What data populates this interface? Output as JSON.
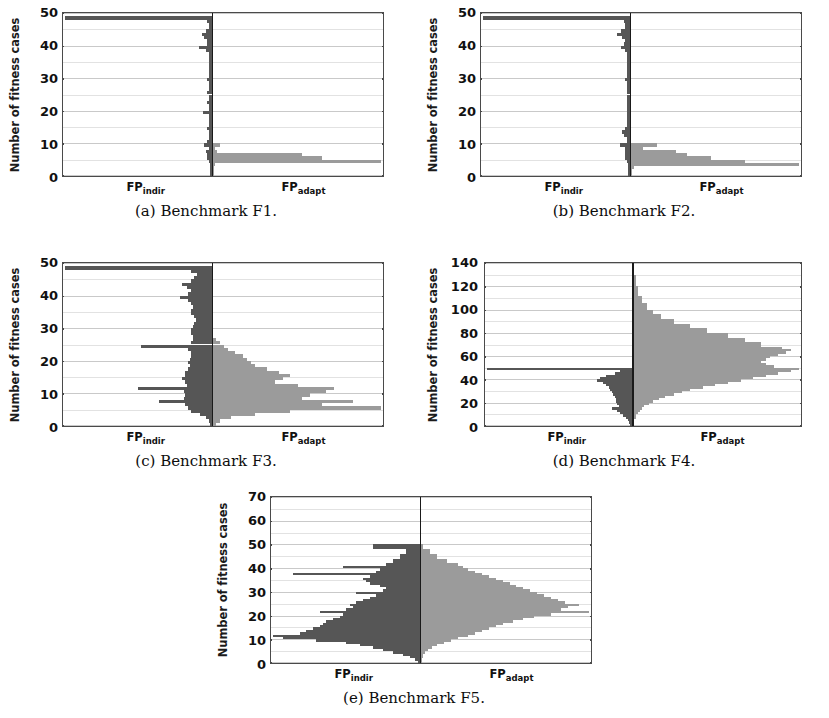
{
  "figure": {
    "ylabel": "Number of fitness cases",
    "left_series_label_main": "FP",
    "left_series_label_sub": "indir",
    "right_series_label_main": "FP",
    "right_series_label_sub": "adapt",
    "colors": {
      "left_bar": "#565656",
      "right_bar": "#9b9b9b",
      "axis": "#4a4a4a",
      "grid": "#c9c9c9",
      "center_line": "#1a1a1a",
      "background": "#ffffff"
    }
  },
  "panels": [
    {
      "key": "a",
      "caption": "(a) Benchmark F1.",
      "yticks": [
        "0",
        "10",
        "20",
        "30",
        "40",
        "50"
      ]
    },
    {
      "key": "b",
      "caption": "(b) Benchmark F2.",
      "yticks": [
        "0",
        "10",
        "20",
        "30",
        "40",
        "50"
      ]
    },
    {
      "key": "c",
      "caption": "(c) Benchmark F3.",
      "yticks": [
        "0",
        "10",
        "20",
        "30",
        "40",
        "50"
      ]
    },
    {
      "key": "d",
      "caption": "(d) Benchmark F4.",
      "yticks": [
        "0",
        "20",
        "40",
        "60",
        "80",
        "100",
        "120",
        "140"
      ]
    },
    {
      "key": "e",
      "caption": "(e) Benchmark F5.",
      "yticks": [
        "0",
        "10",
        "20",
        "30",
        "40",
        "50",
        "60",
        "70"
      ]
    }
  ],
  "chart_data": [
    {
      "id": "a",
      "type": "bar",
      "orientation": "horizontal-butterfly",
      "title": "(a) Benchmark F1.",
      "xlabel": "",
      "ylabel": "Number of fitness cases",
      "ylim": [
        0,
        50
      ],
      "yticks": [
        0,
        10,
        20,
        30,
        40,
        50
      ],
      "grid": true,
      "legend": "none",
      "series": [
        {
          "name": "FP_indir",
          "side": "left",
          "color": "#565656",
          "y": [
            49,
            48,
            47,
            46,
            45,
            44,
            43,
            42,
            41,
            40,
            39,
            38,
            37,
            36,
            35,
            34,
            33,
            32,
            31,
            30,
            29,
            28,
            27,
            26,
            25,
            24,
            23,
            22,
            21,
            20,
            19,
            18,
            17,
            16,
            15,
            14,
            13,
            12,
            11,
            10,
            9,
            8,
            7,
            6,
            5,
            4,
            3,
            2,
            1
          ],
          "values": [
            100,
            3,
            2,
            2,
            4,
            7,
            5,
            3,
            3,
            9,
            4,
            2,
            2,
            2,
            2,
            2,
            2,
            2,
            2,
            3,
            2,
            2,
            2,
            3,
            2,
            2,
            3,
            2,
            2,
            6,
            2,
            2,
            2,
            2,
            3,
            2,
            2,
            2,
            3,
            5,
            2,
            4,
            3,
            3,
            2,
            1,
            1,
            1,
            1
          ]
        },
        {
          "name": "FP_adapt",
          "side": "right",
          "color": "#9b9b9b",
          "y": [
            49,
            48,
            47,
            46,
            45,
            44,
            43,
            42,
            41,
            40,
            39,
            38,
            37,
            36,
            35,
            34,
            33,
            32,
            31,
            30,
            29,
            28,
            27,
            26,
            25,
            24,
            23,
            22,
            21,
            20,
            19,
            18,
            17,
            16,
            15,
            14,
            13,
            12,
            11,
            10,
            9,
            8,
            7,
            6,
            5,
            4,
            3,
            2,
            1
          ],
          "values": [
            0,
            0,
            0,
            0,
            0,
            0,
            0,
            0,
            0,
            0,
            0,
            0,
            0,
            0,
            0,
            0,
            0,
            0,
            0,
            0,
            0,
            0,
            0,
            0,
            0,
            0,
            0,
            0,
            0,
            0,
            0,
            0,
            0,
            0,
            0,
            0,
            0,
            0,
            0,
            5,
            2,
            3,
            52,
            64,
            98,
            2,
            1,
            1,
            1
          ]
        }
      ]
    },
    {
      "id": "b",
      "type": "bar",
      "orientation": "horizontal-butterfly",
      "title": "(b) Benchmark F2.",
      "xlabel": "",
      "ylabel": "Number of fitness cases",
      "ylim": [
        0,
        50
      ],
      "yticks": [
        0,
        10,
        20,
        30,
        40,
        50
      ],
      "grid": true,
      "legend": "none",
      "series": [
        {
          "name": "FP_indir",
          "side": "left",
          "color": "#565656",
          "y": [
            49,
            48,
            47,
            46,
            45,
            44,
            43,
            42,
            41,
            40,
            39,
            38,
            37,
            36,
            35,
            34,
            33,
            32,
            31,
            30,
            29,
            28,
            27,
            26,
            25,
            24,
            23,
            22,
            21,
            20,
            19,
            18,
            17,
            16,
            15,
            14,
            13,
            12,
            11,
            10,
            9,
            8,
            7,
            6,
            5,
            4,
            3,
            2,
            1
          ],
          "values": [
            100,
            4,
            3,
            3,
            6,
            9,
            5,
            3,
            4,
            6,
            3,
            2,
            2,
            2,
            2,
            2,
            2,
            2,
            2,
            3,
            2,
            2,
            2,
            2,
            2,
            2,
            2,
            2,
            2,
            2,
            2,
            2,
            2,
            2,
            3,
            5,
            4,
            2,
            2,
            7,
            3,
            3,
            3,
            3,
            2,
            1,
            1,
            1,
            1
          ]
        },
        {
          "name": "FP_adapt",
          "side": "right",
          "color": "#9b9b9b",
          "y": [
            49,
            48,
            47,
            46,
            45,
            44,
            43,
            42,
            41,
            40,
            39,
            38,
            37,
            36,
            35,
            34,
            33,
            32,
            31,
            30,
            29,
            28,
            27,
            26,
            25,
            24,
            23,
            22,
            21,
            20,
            19,
            18,
            17,
            16,
            15,
            14,
            13,
            12,
            11,
            10,
            9,
            8,
            7,
            6,
            5,
            4,
            3,
            2,
            1
          ],
          "values": [
            0,
            0,
            0,
            0,
            0,
            0,
            0,
            0,
            0,
            0,
            0,
            0,
            0,
            0,
            0,
            0,
            0,
            0,
            0,
            0,
            0,
            0,
            0,
            0,
            0,
            0,
            0,
            0,
            0,
            0,
            0,
            0,
            0,
            0,
            0,
            0,
            0,
            0,
            0,
            14,
            7,
            24,
            30,
            42,
            60,
            88,
            2,
            1,
            1
          ]
        }
      ]
    },
    {
      "id": "c",
      "type": "bar",
      "orientation": "horizontal-butterfly",
      "title": "(c) Benchmark F3.",
      "xlabel": "",
      "ylabel": "Number of fitness cases",
      "ylim": [
        0,
        50
      ],
      "yticks": [
        0,
        10,
        20,
        30,
        40,
        50
      ],
      "grid": true,
      "legend": "none",
      "series": [
        {
          "name": "FP_indir",
          "side": "left",
          "color": "#565656",
          "y": [
            49,
            48,
            47,
            46,
            45,
            44,
            43,
            42,
            41,
            40,
            39,
            38,
            37,
            36,
            35,
            34,
            33,
            32,
            31,
            30,
            29,
            28,
            27,
            26,
            25,
            24,
            23,
            22,
            21,
            20,
            19,
            18,
            17,
            16,
            15,
            14,
            13,
            12,
            11,
            10,
            9,
            8,
            7,
            6,
            5,
            4,
            3,
            2,
            1
          ],
          "values": [
            100,
            14,
            10,
            12,
            14,
            20,
            17,
            14,
            16,
            22,
            16,
            14,
            13,
            14,
            14,
            12,
            11,
            12,
            13,
            14,
            14,
            13,
            13,
            14,
            48,
            16,
            14,
            14,
            15,
            16,
            15,
            16,
            18,
            18,
            20,
            18,
            17,
            50,
            19,
            18,
            19,
            36,
            18,
            16,
            14,
            8,
            4,
            2,
            1
          ]
        },
        {
          "name": "FP_adapt",
          "side": "right",
          "color": "#9b9b9b",
          "y": [
            49,
            48,
            47,
            46,
            45,
            44,
            43,
            42,
            41,
            40,
            39,
            38,
            37,
            36,
            35,
            34,
            33,
            32,
            31,
            30,
            29,
            28,
            27,
            26,
            25,
            24,
            23,
            22,
            21,
            20,
            19,
            18,
            17,
            16,
            15,
            14,
            13,
            12,
            11,
            10,
            9,
            8,
            7,
            6,
            5,
            4,
            3,
            2,
            1
          ],
          "values": [
            0,
            0,
            0,
            0,
            0,
            0,
            0,
            0,
            0,
            0,
            0,
            0,
            0,
            0,
            0,
            0,
            0,
            0,
            0,
            0,
            0,
            0,
            2,
            4,
            6,
            8,
            12,
            16,
            18,
            20,
            22,
            28,
            34,
            40,
            36,
            32,
            44,
            62,
            58,
            50,
            46,
            72,
            56,
            86,
            40,
            22,
            10,
            4,
            2
          ]
        }
      ]
    },
    {
      "id": "d",
      "type": "bar",
      "orientation": "horizontal-butterfly",
      "title": "(d) Benchmark F4.",
      "xlabel": "",
      "ylabel": "Number of fitness cases",
      "ylim": [
        0,
        140
      ],
      "yticks": [
        0,
        20,
        40,
        60,
        80,
        100,
        120,
        140
      ],
      "grid": true,
      "legend": "none",
      "series": [
        {
          "name": "FP_indir",
          "side": "left",
          "color": "#565656",
          "y": [
            138,
            130,
            120,
            110,
            100,
            90,
            80,
            70,
            66,
            62,
            58,
            54,
            50,
            48,
            46,
            44,
            42,
            40,
            38,
            36,
            34,
            32,
            30,
            28,
            26,
            24,
            22,
            20,
            18,
            16,
            14,
            12,
            10,
            8,
            6,
            4,
            2
          ],
          "values": [
            0,
            0,
            0,
            0,
            0,
            0,
            0,
            0,
            0,
            0,
            0,
            0,
            100,
            8,
            12,
            18,
            22,
            24,
            20,
            18,
            16,
            15,
            14,
            13,
            12,
            11,
            11,
            10,
            9,
            14,
            10,
            8,
            6,
            4,
            3,
            2,
            1
          ]
        },
        {
          "name": "FP_adapt",
          "side": "right",
          "color": "#9b9b9b",
          "y": [
            138,
            130,
            120,
            112,
            106,
            100,
            96,
            92,
            88,
            84,
            80,
            76,
            72,
            68,
            66,
            64,
            62,
            60,
            58,
            56,
            54,
            52,
            50,
            48,
            46,
            44,
            42,
            40,
            38,
            36,
            34,
            32,
            30,
            28,
            26,
            24,
            22,
            20,
            18,
            16,
            14,
            12,
            10,
            8,
            6,
            4,
            2
          ],
          "values": [
            1,
            2,
            3,
            5,
            7,
            10,
            14,
            20,
            28,
            36,
            46,
            54,
            62,
            72,
            76,
            74,
            70,
            66,
            64,
            62,
            64,
            68,
            80,
            76,
            70,
            64,
            58,
            52,
            46,
            40,
            34,
            28,
            24,
            20,
            16,
            13,
            10,
            8,
            6,
            5,
            4,
            3,
            2,
            2,
            1,
            1,
            1
          ]
        }
      ]
    },
    {
      "id": "e",
      "type": "bar",
      "orientation": "horizontal-butterfly",
      "title": "(e) Benchmark F5.",
      "xlabel": "",
      "ylabel": "Number of fitness cases",
      "ylim": [
        0,
        70
      ],
      "yticks": [
        0,
        10,
        20,
        30,
        40,
        50,
        60,
        70
      ],
      "grid": true,
      "legend": "none",
      "series": [
        {
          "name": "FP_indir",
          "side": "left",
          "color": "#565656",
          "y": [
            50,
            48,
            46,
            44,
            42,
            41,
            40,
            39,
            38,
            37,
            36,
            35,
            34,
            33,
            32,
            31,
            30,
            29,
            28,
            27,
            26,
            25,
            24,
            23,
            22,
            21,
            20,
            19,
            18,
            17,
            16,
            15,
            14,
            13,
            12,
            11,
            10,
            9,
            8,
            7,
            6,
            5,
            4,
            3,
            2,
            1
          ],
          "values": [
            28,
            8,
            12,
            16,
            20,
            46,
            24,
            26,
            76,
            30,
            34,
            32,
            30,
            24,
            20,
            22,
            38,
            26,
            30,
            34,
            38,
            42,
            40,
            44,
            60,
            46,
            48,
            52,
            56,
            58,
            60,
            64,
            68,
            72,
            88,
            82,
            62,
            44,
            36,
            28,
            22,
            16,
            10,
            6,
            3,
            1
          ]
        },
        {
          "name": "FP_adapt",
          "side": "right",
          "color": "#9b9b9b",
          "y": [
            50,
            48,
            46,
            44,
            42,
            41,
            40,
            39,
            38,
            37,
            36,
            35,
            34,
            33,
            32,
            31,
            30,
            29,
            28,
            27,
            26,
            25,
            24,
            23,
            22,
            21,
            20,
            19,
            18,
            17,
            16,
            15,
            14,
            13,
            12,
            11,
            10,
            9,
            8,
            7,
            6,
            5,
            4,
            3,
            2,
            1
          ],
          "values": [
            2,
            6,
            10,
            16,
            22,
            25,
            28,
            32,
            36,
            40,
            44,
            48,
            52,
            56,
            60,
            64,
            68,
            72,
            76,
            80,
            84,
            92,
            86,
            82,
            98,
            76,
            66,
            60,
            54,
            48,
            44,
            40,
            36,
            32,
            28,
            22,
            18,
            14,
            10,
            7,
            5,
            3,
            2,
            2,
            1,
            1
          ]
        }
      ]
    }
  ]
}
